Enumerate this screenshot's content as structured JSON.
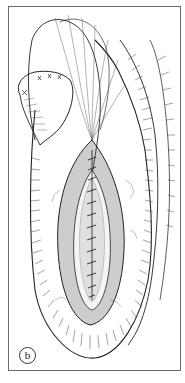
{
  "figure": {
    "panel_label": "b",
    "colors": {
      "ink": "#222222",
      "frame": "#6a6a6a",
      "shading": "#555555",
      "background": "#ffffff"
    }
  }
}
